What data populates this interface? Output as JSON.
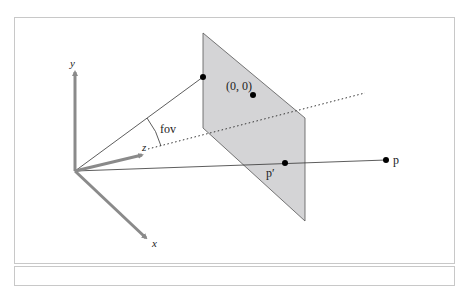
{
  "diagram": {
    "axes": {
      "y_label": "y",
      "z_label": "z",
      "x_label": "x"
    },
    "angle_label": "fov",
    "image_plane": {
      "center_label": "(0, 0)",
      "projected_point_label": "p′"
    },
    "point_label": "p",
    "colors": {
      "plane_fill": "#d4d4d6",
      "plane_edge": "#555555",
      "axis": "#8a8a8a",
      "line": "#333333",
      "frame_border": "#c8c8c8"
    }
  }
}
